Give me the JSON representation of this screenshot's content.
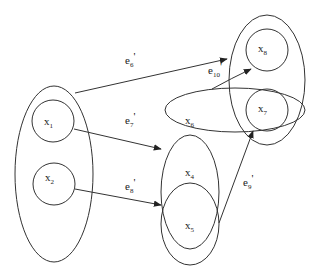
{
  "diagram": {
    "type": "directed hypergraph",
    "background": "#ffffff",
    "stroke_color": "#333333",
    "nodes": [
      {
        "id": "x1",
        "base": "x",
        "sub": "1"
      },
      {
        "id": "x2",
        "base": "x",
        "sub": "2"
      },
      {
        "id": "x4",
        "base": "x",
        "sub": "4"
      },
      {
        "id": "x5",
        "base": "x",
        "sub": "5"
      },
      {
        "id": "x6",
        "base": "x",
        "sub": "6"
      },
      {
        "id": "x7",
        "base": "x",
        "sub": "7"
      },
      {
        "id": "x8",
        "base": "x",
        "sub": "8"
      }
    ],
    "groups": [
      {
        "id": "group-x1-x2",
        "members": [
          "x1",
          "x2"
        ]
      },
      {
        "id": "group-x6-x4",
        "members": [
          "x6",
          "x4"
        ]
      },
      {
        "id": "group-x4-x5",
        "members": [
          "x4",
          "x5"
        ]
      },
      {
        "id": "group-x6-x7",
        "members": [
          "x6",
          "x7"
        ]
      },
      {
        "id": "group-x8-x7",
        "members": [
          "x8",
          "x7"
        ]
      }
    ],
    "edges": [
      {
        "id": "e6",
        "base": "e",
        "sub": "6",
        "prime": "'",
        "from": "group-x1-x2",
        "to": "group-x8-x7"
      },
      {
        "id": "e7",
        "base": "e",
        "sub": "7",
        "prime": "'",
        "from": "x1",
        "to": "group-x6-x4"
      },
      {
        "id": "e8",
        "base": "e",
        "sub": "8",
        "prime": "'",
        "from": "x2",
        "to": "group-x4-x5"
      },
      {
        "id": "e9",
        "base": "e",
        "sub": "9",
        "prime": "'",
        "from": "group-x4-x5",
        "to": "x7"
      },
      {
        "id": "e10",
        "base": "e",
        "sub": "10",
        "prime": "'",
        "from": "group-x6-x7",
        "to": "x8"
      }
    ]
  }
}
